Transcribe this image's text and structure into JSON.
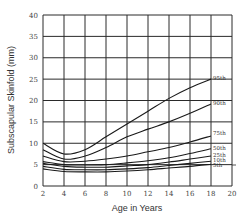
{
  "chart_data": {
    "type": "line",
    "title": "",
    "xlabel": "Age in Years",
    "ylabel": "Subscapular Skinfold (mm)",
    "xlim": [
      2,
      20
    ],
    "ylim": [
      0,
      40
    ],
    "x_ticks": [
      2,
      4,
      6,
      8,
      10,
      12,
      14,
      16,
      18,
      20
    ],
    "y_ticks": [
      0,
      5,
      10,
      15,
      20,
      25,
      30,
      35,
      40
    ],
    "grid": true,
    "legend": "inline labels at right end of curves",
    "x": [
      2,
      4,
      6,
      8,
      10,
      12,
      14,
      16,
      18
    ],
    "series": [
      {
        "name": "95th",
        "values": [
          10,
          7.5,
          8.5,
          11.5,
          14.5,
          17.5,
          20.5,
          23,
          25
        ]
      },
      {
        "name": "90th",
        "values": [
          8.5,
          6.3,
          7,
          9,
          11.5,
          13.3,
          15,
          17,
          19.2
        ]
      },
      {
        "name": "75th",
        "values": [
          7,
          5.7,
          5.8,
          6.3,
          7,
          8,
          9,
          10.3,
          11.7
        ]
      },
      {
        "name": "50th",
        "values": [
          5.7,
          5,
          4.9,
          5,
          5.4,
          5.9,
          6.6,
          7.6,
          8.7
        ]
      },
      {
        "name": "25th",
        "values": [
          5.3,
          4.6,
          4.4,
          4.4,
          4.7,
          5,
          5.6,
          6.3,
          7
        ]
      },
      {
        "name": "10th",
        "values": [
          4.6,
          3.9,
          3.8,
          3.8,
          4,
          4.3,
          4.8,
          5.3,
          5.8
        ]
      },
      {
        "name": "5th",
        "values": [
          4,
          3.4,
          3.3,
          3.3,
          3.5,
          3.8,
          4.2,
          4.6,
          5.1
        ]
      }
    ],
    "label_offsets": {
      "95th": 0,
      "90th": 0,
      "75th": -2,
      "50th": 0,
      "25th": 0,
      "10th": 0,
      "5th": 2
    }
  },
  "style": {
    "grid_color": "#2a2a2a",
    "line_color": "#1a1a1a"
  }
}
